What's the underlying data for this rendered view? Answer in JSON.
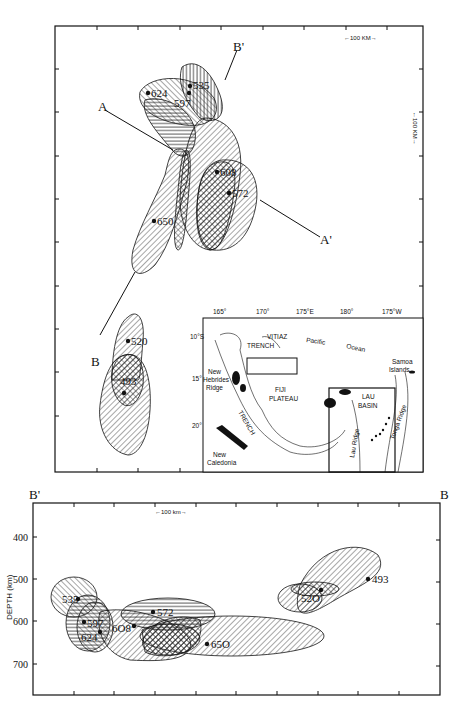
{
  "figure": {
    "map_panel": {
      "profile_labels": {
        "A": "A",
        "A_prime": "A'",
        "B": "B",
        "B_prime": "B'"
      },
      "scale_horizontal": "←100 KM→",
      "scale_vertical": "←100 KM→",
      "events": [
        {
          "id": "535",
          "label": "535"
        },
        {
          "id": "624",
          "label": "624"
        },
        {
          "id": "597",
          "label": "597"
        },
        {
          "id": "608",
          "label": "608"
        },
        {
          "id": "572",
          "label": "572"
        },
        {
          "id": "650",
          "label": "650"
        },
        {
          "id": "520",
          "label": "520"
        },
        {
          "id": "493",
          "label": "493"
        }
      ]
    },
    "inset_map": {
      "longitudes": [
        "165°",
        "170°",
        "175°E",
        "180°",
        "175°W"
      ],
      "latitudes": [
        "10°S",
        "15°",
        "20°"
      ],
      "features": {
        "vitiaz": "VITIAZ",
        "trench": "TRENCH",
        "pacific": "Pacific",
        "ocean": "Ocean",
        "samoa1": "Samoa",
        "samoa2": "Islands",
        "new_hebrides1": "New",
        "new_hebrides2": "Hebrides",
        "new_hebrides3": "Ridge",
        "fiji1": "FIJI",
        "fiji2": "PLATEAU",
        "lau1": "LAU",
        "lau2": "BASIN",
        "lau_ridge": "Lau Ridge",
        "tonga_ridge": "Tonga Ridge",
        "nh_trench": "TRENCH",
        "new_caledonia1": "New",
        "new_caledonia2": "Caledonia"
      }
    },
    "section_panel": {
      "left_label": "B'",
      "right_label": "B",
      "scale": "←100 km→",
      "y_axis_label": "DEPTH (km)",
      "y_ticks": [
        "400",
        "500",
        "600",
        "700"
      ],
      "events": [
        {
          "id": "535",
          "label": "535"
        },
        {
          "id": "597",
          "label": "597"
        },
        {
          "id": "624",
          "label": "624"
        },
        {
          "id": "608",
          "label": "6O8"
        },
        {
          "id": "572",
          "label": "572"
        },
        {
          "id": "650",
          "label": "65O"
        },
        {
          "id": "520",
          "label": "52O"
        },
        {
          "id": "493",
          "label": "493"
        }
      ]
    }
  }
}
